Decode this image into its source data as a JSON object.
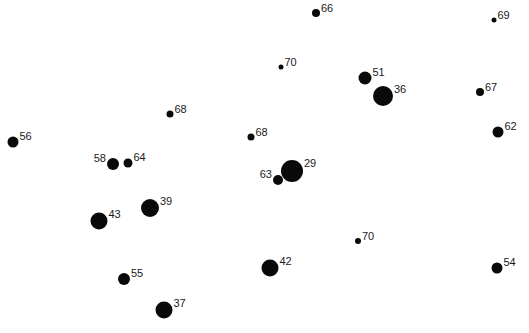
{
  "chart_data": {
    "type": "scatter",
    "title": "",
    "xlabel": "",
    "ylabel": "",
    "grid": false,
    "legend": null,
    "axes_visible": false,
    "size_encoding": "dot radius inversely proportional to label value",
    "points": [
      {
        "label": "66",
        "x": 316,
        "y": 13,
        "r": 4,
        "label_side": "right"
      },
      {
        "label": "69",
        "x": 494,
        "y": 20,
        "r": 2.5,
        "label_side": "right"
      },
      {
        "label": "70",
        "x": 281,
        "y": 67,
        "r": 2.5,
        "label_side": "right"
      },
      {
        "label": "51",
        "x": 365,
        "y": 78,
        "r": 6.5,
        "label_side": "right"
      },
      {
        "label": "36",
        "x": 383,
        "y": 96,
        "r": 10,
        "label_side": "right"
      },
      {
        "label": "67",
        "x": 480,
        "y": 92,
        "r": 4,
        "label_side": "right"
      },
      {
        "label": "68",
        "x": 170,
        "y": 114,
        "r": 3.5,
        "label_side": "right"
      },
      {
        "label": "62",
        "x": 498,
        "y": 132,
        "r": 5.5,
        "label_side": "right"
      },
      {
        "label": "56",
        "x": 13,
        "y": 142,
        "r": 5.5,
        "label_side": "right"
      },
      {
        "label": "68",
        "x": 251,
        "y": 137,
        "r": 3.5,
        "label_side": "right"
      },
      {
        "label": "58",
        "x": 113,
        "y": 164,
        "r": 6,
        "label_side": "left"
      },
      {
        "label": "64",
        "x": 128,
        "y": 163,
        "r": 4.5,
        "label_side": "right"
      },
      {
        "label": "29",
        "x": 292,
        "y": 171,
        "r": 11,
        "label_side": "right"
      },
      {
        "label": "63",
        "x": 278,
        "y": 180,
        "r": 5,
        "label_side": "left"
      },
      {
        "label": "39",
        "x": 150,
        "y": 208,
        "r": 9,
        "label_side": "right"
      },
      {
        "label": "43",
        "x": 99,
        "y": 221,
        "r": 8.5,
        "label_side": "right"
      },
      {
        "label": "70",
        "x": 358,
        "y": 241,
        "r": 3,
        "label_side": "right"
      },
      {
        "label": "42",
        "x": 270,
        "y": 268,
        "r": 8.5,
        "label_side": "right"
      },
      {
        "label": "54",
        "x": 497,
        "y": 268,
        "r": 5.5,
        "label_side": "right"
      },
      {
        "label": "55",
        "x": 124,
        "y": 279,
        "r": 6,
        "label_side": "right"
      },
      {
        "label": "37",
        "x": 164,
        "y": 310,
        "r": 8.5,
        "label_side": "right"
      }
    ],
    "colors": {
      "dot": "#0a0a0a",
      "label": "#1a1a1a",
      "background": "#ffffff"
    }
  }
}
